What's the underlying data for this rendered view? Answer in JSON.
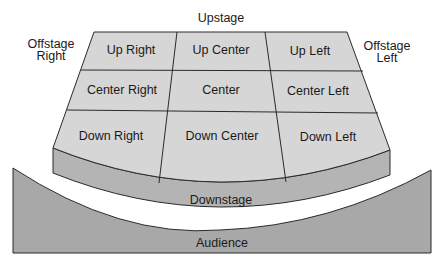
{
  "colors": {
    "stage_surface": "#d6d6d6",
    "apron": "#b4b4b4",
    "audience": "#a8a8a8",
    "line": "#2a2a2a",
    "background": "#ffffff"
  },
  "labels": {
    "upstage": "Upstage",
    "offstage_right": [
      "Offstage",
      "Right"
    ],
    "offstage_left": [
      "Offstage",
      "Left"
    ],
    "downstage": "Downstage",
    "audience": "Audience"
  },
  "grid": {
    "rows": [
      [
        "Up Right",
        "Up Center",
        "Up Left"
      ],
      [
        "Center Right",
        "Center",
        "Center Left"
      ],
      [
        "Down Right",
        "Down Center",
        "Down Left"
      ]
    ]
  }
}
